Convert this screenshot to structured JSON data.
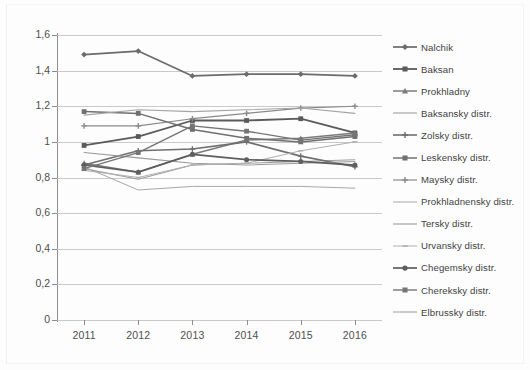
{
  "chart_data": {
    "type": "line",
    "title": "",
    "xlabel": "",
    "ylabel": "",
    "categories": [
      "2011",
      "2012",
      "2013",
      "2014",
      "2015",
      "2016"
    ],
    "x": [
      2011,
      2012,
      2013,
      2014,
      2015,
      2016
    ],
    "ylim": [
      0,
      1.6
    ],
    "ytick_labels": [
      "0",
      "0,2",
      "0,4",
      "0,6",
      "0,8",
      "1",
      "1,2",
      "1,4",
      "1,6"
    ],
    "ytick_values": [
      0,
      0.2,
      0.4,
      0.6,
      0.8,
      1.0,
      1.2,
      1.4,
      1.6
    ],
    "grid": true,
    "legend_position": "right",
    "decimal_separator": ",",
    "series": [
      {
        "name": "Nalchik",
        "values": [
          1.49,
          1.51,
          1.37,
          1.38,
          1.38,
          1.37
        ],
        "color": "#6b6b6b",
        "marker": "diamond",
        "width": 1.7
      },
      {
        "name": "Baksan",
        "values": [
          0.98,
          1.03,
          1.12,
          1.12,
          1.13,
          1.05
        ],
        "color": "#5a5a5a",
        "marker": "square",
        "width": 1.8
      },
      {
        "name": "Prokhladny",
        "values": [
          0.88,
          0.83,
          0.93,
          1.01,
          1.02,
          1.05
        ],
        "color": "#7b7b7b",
        "marker": "triangle",
        "width": 1.5
      },
      {
        "name": "Baksansky distr.",
        "values": [
          0.85,
          0.79,
          0.87,
          0.88,
          0.89,
          0.9
        ],
        "color": "#9e9e9e",
        "marker": "none",
        "width": 1.1
      },
      {
        "name": "Zolsky distr.",
        "values": [
          0.87,
          0.95,
          0.96,
          1.0,
          0.92,
          0.86
        ],
        "color": "#6f6f6f",
        "marker": "plus",
        "width": 1.6
      },
      {
        "name": "Leskensky distr.",
        "values": [
          1.17,
          1.16,
          1.07,
          1.02,
          1.0,
          1.03
        ],
        "color": "#707070",
        "marker": "square",
        "width": 1.5
      },
      {
        "name": "Maysky distr.",
        "values": [
          1.09,
          1.09,
          1.13,
          1.16,
          1.19,
          1.2
        ],
        "color": "#8a8a8a",
        "marker": "plus",
        "width": 1.2
      },
      {
        "name": "Prokhladnensky distr.",
        "values": [
          0.86,
          0.73,
          0.75,
          0.75,
          0.75,
          0.74
        ],
        "color": "#a8a8a8",
        "marker": "none",
        "width": 1.0
      },
      {
        "name": "Tersky distr.",
        "values": [
          0.94,
          0.91,
          0.88,
          0.87,
          0.88,
          0.89
        ],
        "color": "#9a9a9a",
        "marker": "none",
        "width": 1.1
      },
      {
        "name": "Urvansky distr.",
        "values": [
          0.84,
          0.8,
          0.87,
          0.88,
          0.95,
          1.0
        ],
        "color": "#b0b0b0",
        "marker": "dash",
        "width": 1.0
      },
      {
        "name": "Chegemsky distr.",
        "values": [
          0.87,
          0.83,
          0.93,
          0.9,
          0.89,
          0.87
        ],
        "color": "#5e5e5e",
        "marker": "circle",
        "width": 1.7
      },
      {
        "name": "Chereksky distr.",
        "values": [
          0.85,
          0.94,
          1.09,
          1.06,
          1.01,
          1.04
        ],
        "color": "#757575",
        "marker": "square",
        "width": 1.4
      },
      {
        "name": "Elbrussky distr.",
        "values": [
          1.15,
          1.18,
          1.17,
          1.18,
          1.19,
          1.16
        ],
        "color": "#a4a4a4",
        "marker": "none",
        "width": 1.1
      }
    ]
  }
}
